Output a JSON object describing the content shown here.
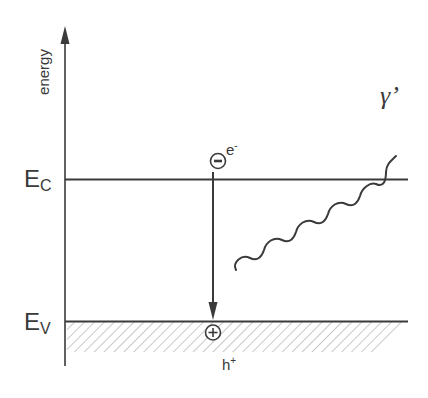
{
  "diagram": {
    "type": "band_diagram",
    "axis": {
      "label": "energy"
    },
    "levels": {
      "conduction": {
        "main": "E",
        "sub": "C"
      },
      "valence": {
        "main": "E",
        "sub": "V"
      }
    },
    "electron": {
      "symbol": "−",
      "label": "e",
      "superscript": "-"
    },
    "hole": {
      "symbol": "+",
      "label": "h",
      "superscript": "+"
    },
    "photon": {
      "label": "γ’"
    },
    "colors": {
      "line": "#3a3a3a",
      "hatch": "#9a9a9a",
      "background": "#ffffff"
    }
  }
}
